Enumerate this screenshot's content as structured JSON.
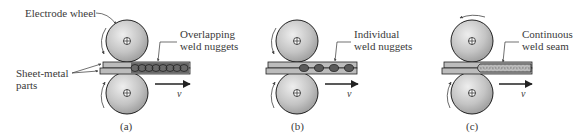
{
  "labels": {
    "electrode_wheel": "Electrode wheel",
    "sheet_metal_1": "Sheet-metal",
    "sheet_metal_2": "parts",
    "overlapping_1": "Overlapping",
    "overlapping_2": "weld nuggets",
    "individual_1": "Individual",
    "individual_2": "weld nuggets",
    "continuous_1": "Continuous",
    "continuous_2": "weld seam",
    "velocity": "v"
  },
  "captions": {
    "a": "(a)",
    "b": "(b)",
    "c": "(c)"
  },
  "colors": {
    "wheel_fill": "#c8c8c8",
    "sheet_fill": "#b9b9b9",
    "stroke": "#222222",
    "nugget": "#555555"
  }
}
